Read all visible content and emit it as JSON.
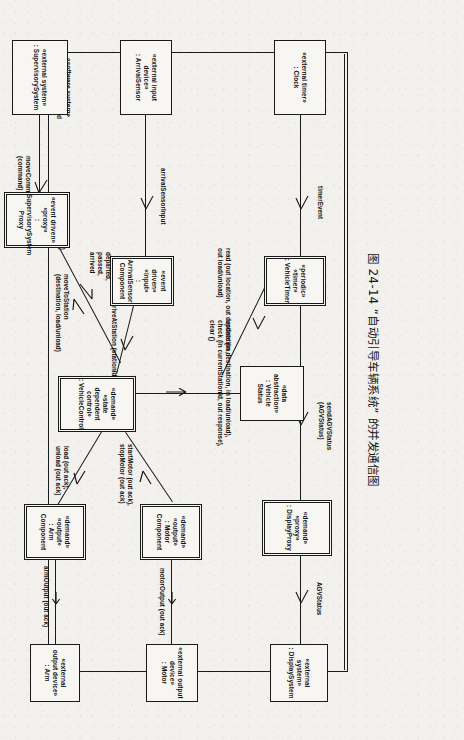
{
  "caption": "图 24-14  “自动引导车辆系统” 的并发通信图",
  "system_boundary": {
    "label": "«software system»\n: AutomatedGuided\nVehicleSystem"
  },
  "nodes": {
    "clock": {
      "stereotype": "«external timer»",
      "name": ": Clock"
    },
    "vehicle_timer": {
      "stereotype": "«periodic»\n«timer»",
      "name": ": VehicleTimer"
    },
    "vehicle_status": {
      "stereotype": "«data\nabstraction»",
      "name": ": Vehicle\nStatus"
    },
    "display_proxy": {
      "stereotype": "«demand»\n«proxy»",
      "name": ": DisplayProxy"
    },
    "display_system": {
      "stereotype": "«external system»",
      "name": ": DisplaySystem"
    },
    "arrival_sensor": {
      "stereotype": "«external input\ndevice»",
      "name": ": ArrivalSensor"
    },
    "arrival_sensor_component": {
      "stereotype": "«event driven»\n«input»",
      "name": ": ArrivalSensor\nComponent"
    },
    "vehicle_control": {
      "stereotype": "«demand»\n«state dependent\ncontrol»",
      "name": ": VehicleControl"
    },
    "motor_component": {
      "stereotype": "«demand»\n«output»",
      "name": ": Motor\nComponent"
    },
    "motor_device": {
      "stereotype": "«external output\ndevice»",
      "name": ": Motor"
    },
    "arm_component": {
      "stereotype": "«demand»\n«output»",
      "name": ": Arm\nComponent"
    },
    "arm_device": {
      "stereotype": "«external\noutput device»",
      "name": ": Arm"
    },
    "supervisory_system": {
      "stereotype": "«external system»",
      "name": ": SupervisorySystem"
    },
    "supervisory_proxy": {
      "stereotype": "«event driven»\n«proxy»",
      "name": ": SupervisorySystem\nProxy"
    }
  },
  "messages": {
    "timer_event": "timerEvent",
    "send_agv_status": "sendAGVStatus\n(AGVStatus)",
    "agv_status": "AGVStatus",
    "read": "read (out location, out destination,\nout load/unload)",
    "update_check_clear": "update (in destination, in load/unload),\ncheck (in currentStationId, out response),\nclear ()",
    "arrival_sensor_input": "arrivalSensorInput",
    "arrive_at_station": "arriveAtStation (stationId)",
    "start_stop_motor": "startMotor (out ack),\nstopMotor (out ack)",
    "motor_output": "motorOutput (out ack)",
    "load_unload": "load (out ack),\nunload (out ack)",
    "arm_output": "armOutput (out ack)",
    "move_to_station": "moveToStation\n(destination, load/unload)",
    "departed_passed_arrived": "departed,\npassed,\narrived",
    "move_command": "moveCommand\n(command)",
    "agv_ack": "AGVAck (status)"
  },
  "colors": {
    "line": "#1a1a1a",
    "box_fill": "#f7f6f3",
    "paper": "#f2f1ee",
    "text": "#111111"
  }
}
